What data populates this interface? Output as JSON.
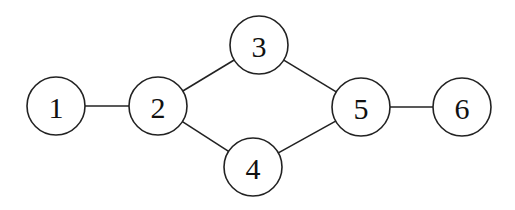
{
  "diagram": {
    "type": "undirected-graph",
    "node_radius": 29,
    "nodes": [
      {
        "id": "1",
        "label": "1",
        "x": 56,
        "y": 106
      },
      {
        "id": "2",
        "label": "2",
        "x": 158,
        "y": 106
      },
      {
        "id": "3",
        "label": "3",
        "x": 259,
        "y": 45
      },
      {
        "id": "4",
        "label": "4",
        "x": 253,
        "y": 167
      },
      {
        "id": "5",
        "label": "5",
        "x": 361,
        "y": 107
      },
      {
        "id": "6",
        "label": "6",
        "x": 462,
        "y": 107
      }
    ],
    "edges": [
      {
        "from": "1",
        "to": "2"
      },
      {
        "from": "2",
        "to": "3"
      },
      {
        "from": "2",
        "to": "4"
      },
      {
        "from": "3",
        "to": "5"
      },
      {
        "from": "4",
        "to": "5"
      },
      {
        "from": "5",
        "to": "6"
      }
    ]
  }
}
